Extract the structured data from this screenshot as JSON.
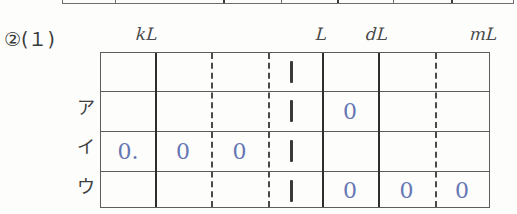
{
  "problem": {
    "number_label": "②(１)"
  },
  "colors": {
    "ink_blue": "#6577b4",
    "rule_dark": "#2e2e2e",
    "rule_light": "#5d5d5d",
    "paper": "#fdfdfc"
  },
  "table": {
    "unit_headers": [
      {
        "label": "kL",
        "column": 1
      },
      {
        "label": "L",
        "column": 4
      },
      {
        "label": "dL",
        "column": 5
      },
      {
        "label": "mL",
        "column": 7
      }
    ],
    "column_count": 7,
    "row_labels": [
      "",
      "ア",
      "イ",
      "ウ"
    ],
    "rows": [
      {
        "label": "",
        "cells": [
          "",
          "",
          "",
          "1",
          "",
          "",
          ""
        ]
      },
      {
        "label": "ア",
        "cells": [
          "",
          "",
          "",
          "1",
          "0",
          "",
          ""
        ]
      },
      {
        "label": "イ",
        "cells": [
          "0.",
          "0",
          "0",
          "1",
          "",
          "",
          ""
        ]
      },
      {
        "label": "ウ",
        "cells": [
          "",
          "",
          "",
          "1",
          "0",
          "0",
          "0"
        ]
      }
    ]
  }
}
